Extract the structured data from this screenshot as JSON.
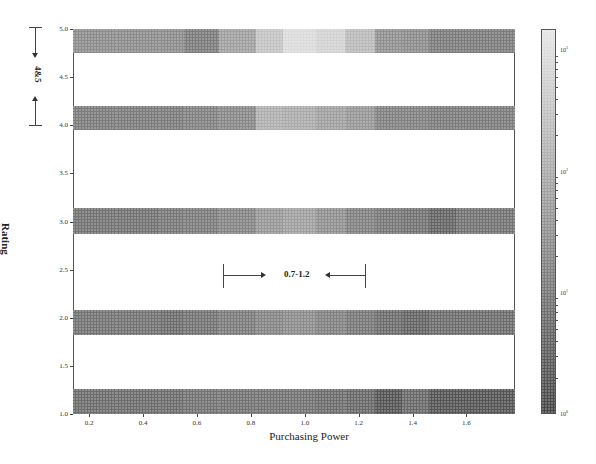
{
  "chart_data": {
    "type": "heatmap",
    "title": "",
    "xlabel": "Purchasing Power",
    "ylabel": "Rating",
    "xlim": [
      0.14,
      1.78
    ],
    "ylim": [
      1.0,
      5.0
    ],
    "xticks": [
      "0.2",
      "0.4",
      "0.6",
      "0.8",
      "1.0",
      "1.2",
      "1.4",
      "1.6"
    ],
    "yticks": [
      "1.0",
      "1.5",
      "2.0",
      "2.5",
      "3.0",
      "3.5",
      "4.0",
      "4.5",
      "5.0"
    ],
    "colorbar": {
      "scale": "log",
      "range": [
        1,
        1500
      ],
      "ticks": [
        "10^0",
        "10^1",
        "10^2",
        "10^3"
      ],
      "colormap": "gray (dark = low, light = high), dotted hatch texture"
    },
    "bin_edges_x": [
      0.14,
      0.3,
      0.46,
      0.55,
      0.68,
      0.82,
      0.92,
      1.04,
      1.15,
      1.26,
      1.36,
      1.46,
      1.56,
      1.78
    ],
    "rows": [
      {
        "y_center": 4.875,
        "y_range": [
          4.75,
          5.0
        ],
        "values": [
          25,
          25,
          25,
          12,
          60,
          300,
          900,
          600,
          200,
          30,
          25,
          12,
          12
        ]
      },
      {
        "y_center": 4.07,
        "y_range": [
          3.95,
          4.2
        ],
        "values": [
          12,
          12,
          12,
          15,
          20,
          120,
          100,
          60,
          40,
          15,
          15,
          12,
          12
        ]
      },
      {
        "y_center": 3.0,
        "y_range": [
          2.87,
          3.14
        ],
        "values": [
          8,
          8,
          10,
          12,
          18,
          40,
          60,
          30,
          15,
          10,
          8,
          4,
          8
        ]
      },
      {
        "y_center": 1.95,
        "y_range": [
          1.82,
          2.08
        ],
        "values": [
          8,
          8,
          6,
          8,
          12,
          18,
          25,
          15,
          10,
          6,
          4,
          6,
          6
        ]
      },
      {
        "y_center": 1.12,
        "y_range": [
          1.0,
          1.26
        ],
        "values": [
          6,
          6,
          6,
          8,
          8,
          8,
          8,
          6,
          5,
          2,
          5,
          2,
          2
        ]
      }
    ],
    "annotations": [
      {
        "text": "4&5",
        "orientation": "vertical",
        "span": [
          4.0,
          5.0
        ],
        "position": "left of y-axis"
      },
      {
        "text": "0.7-1.2",
        "orientation": "horizontal",
        "span": [
          0.7,
          1.22
        ],
        "y": 2.4
      }
    ],
    "grid": false,
    "legend": "colorbar right"
  },
  "labels": {
    "xlabel": "Purchasing Power",
    "ylabel": "Rating",
    "ann_vertical": "4&5",
    "ann_horizontal": "0.7-1.2",
    "cb_0": "10",
    "cb_0_exp": "0",
    "cb_1": "10",
    "cb_1_exp": "1",
    "cb_2": "10",
    "cb_2_exp": "2",
    "cb_3": "10",
    "cb_3_exp": "3"
  },
  "xticks": [
    "0.2",
    "0.4",
    "0.6",
    "0.8",
    "1.0",
    "1.2",
    "1.4",
    "1.6"
  ],
  "yticks": [
    "1.0",
    "1.5",
    "2.0",
    "2.5",
    "3.0",
    "3.5",
    "4.0",
    "4.5",
    "5.0"
  ]
}
